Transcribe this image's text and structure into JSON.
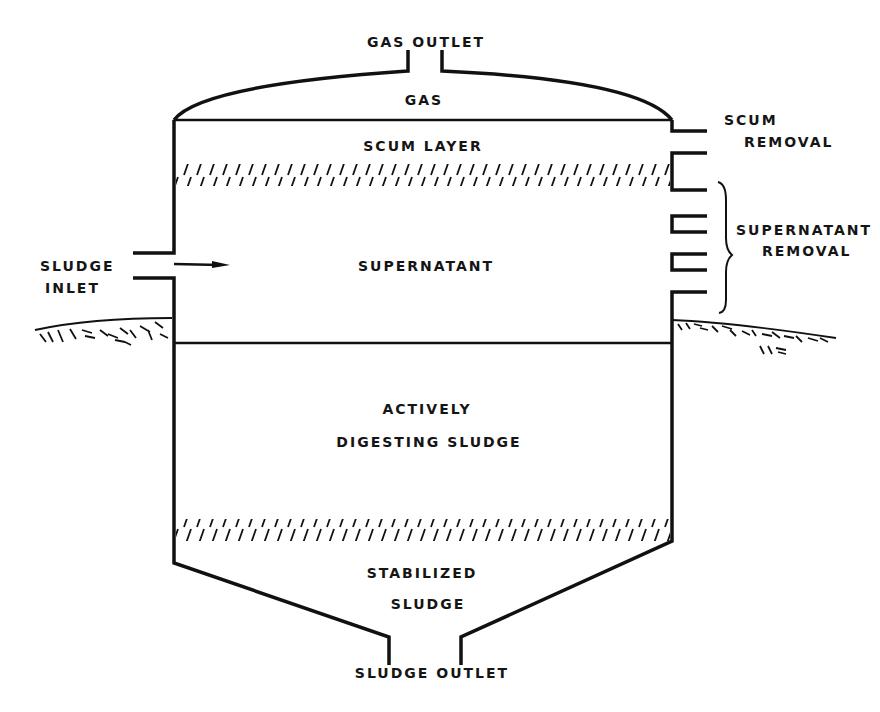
{
  "diagram": {
    "type": "anaerobic-digester-cross-section",
    "labels": {
      "gas_outlet": "GAS  OUTLET",
      "gas": "GAS",
      "scum_layer": "SCUM  LAYER",
      "scum_removal_1": "SCUM",
      "scum_removal_2": "REMOVAL",
      "supernatant": "SUPERNATANT",
      "supernatant_removal_1": "SUPERNATANT",
      "supernatant_removal_2": "REMOVAL",
      "sludge_inlet_1": "SLUDGE",
      "sludge_inlet_2": "INLET",
      "actively_1": "ACTIVELY",
      "actively_2": "DIGESTING  SLUDGE",
      "stabilized_1": "STABILIZED",
      "stabilized_2": "SLUDGE",
      "sludge_outlet": "SLUDGE  OUTLET"
    },
    "zones": [
      "Gas",
      "Scum layer",
      "Supernatant",
      "Actively digesting sludge",
      "Stabilized sludge"
    ],
    "line_color": "#111111",
    "background": "#ffffff"
  }
}
